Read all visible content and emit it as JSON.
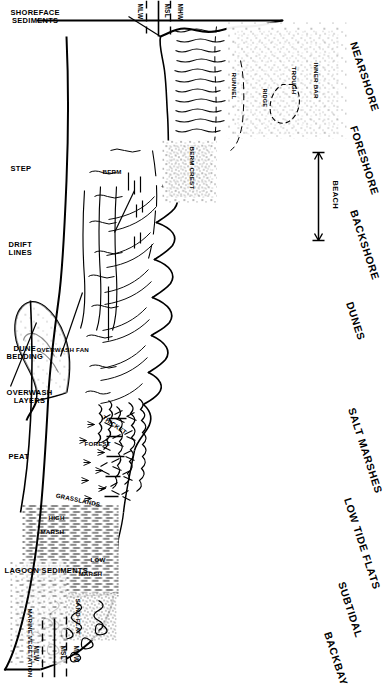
{
  "figure": {
    "orientation_note": "rotated 90 degrees",
    "ink_color": "#000000",
    "background_color": "#ffffff"
  },
  "top_zone_labels": [
    {
      "name": "nearshore",
      "text": "NEARSHORE"
    },
    {
      "name": "foreshore",
      "text": "FORESHORE"
    },
    {
      "name": "backshore",
      "text": "BACKSHORE"
    },
    {
      "name": "dunes",
      "text": "DUNES"
    },
    {
      "name": "salt-marshes",
      "text": "SALT MARSHES"
    },
    {
      "name": "low-tide-flats",
      "text": "LOW TIDE FLATS"
    },
    {
      "name": "subtidal",
      "text": "SUBTIDAL"
    },
    {
      "name": "backbay",
      "text": "BACKBAY"
    }
  ],
  "bottom_unit_labels": [
    {
      "name": "shoreface-sediments",
      "line1": "SHOREFACE",
      "line2": "SEDIMENTS"
    },
    {
      "name": "step",
      "line1": "STEP",
      "line2": ""
    },
    {
      "name": "drift-lines",
      "line1": "DRIFT",
      "line2": "LINES"
    },
    {
      "name": "dune-bedding",
      "line1": "DUNE",
      "line2": "BEDDING"
    },
    {
      "name": "overwash-layers",
      "line1": "OVERWASH",
      "line2": "LAYERS"
    },
    {
      "name": "peat",
      "line1": "PEAT",
      "line2": ""
    },
    {
      "name": "lagoon-sediments",
      "line1": "LAGOON SEDIMENTS",
      "line2": ""
    }
  ],
  "tide_levels_seaward": [
    {
      "name": "mhw",
      "text": "MHW",
      "style": "dashed"
    },
    {
      "name": "msl",
      "text": "MSL",
      "style": "solid"
    },
    {
      "name": "mlw",
      "text": "MLW",
      "style": "dashed"
    }
  ],
  "tide_levels_bayward": [
    {
      "name": "mhw",
      "text": "MHW",
      "style": "dashed"
    },
    {
      "name": "msl",
      "text": "MSL",
      "style": "solid"
    },
    {
      "name": "mlw",
      "text": "MLW",
      "style": "dashed"
    }
  ],
  "interior_labels": [
    {
      "name": "inner-bar",
      "text": "INNER BAR"
    },
    {
      "name": "trough",
      "text": "TROUGH"
    },
    {
      "name": "ridge",
      "text": "RIDGE"
    },
    {
      "name": "runnel",
      "text": "RUNNEL"
    },
    {
      "name": "berm-crest",
      "text": "BERM CREST"
    },
    {
      "name": "berm",
      "text": "BERM"
    },
    {
      "name": "thicket",
      "text": "THICKET"
    },
    {
      "name": "forest",
      "text": "FOREST"
    },
    {
      "name": "grasslands",
      "text": "GRASSLANDS"
    },
    {
      "name": "overwash-fan",
      "text": "OVERWASH FAN"
    },
    {
      "name": "high-marsh",
      "text": "HIGH"
    },
    {
      "name": "high-marsh-2",
      "text": "MARSH"
    },
    {
      "name": "low-marsh",
      "text": "LOW"
    },
    {
      "name": "low-marsh-2",
      "text": "MARSH"
    },
    {
      "name": "sand-flat",
      "text": "SAND FLAT"
    },
    {
      "name": "marine-vegetation",
      "text": "MARINE VEGETATION"
    }
  ],
  "beach_extent": {
    "name": "beach-bracket",
    "text": "BEACH"
  }
}
